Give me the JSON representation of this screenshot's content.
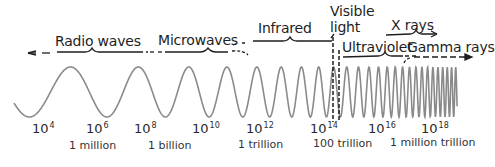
{
  "diagram": {
    "bands": [
      {
        "name": "Radio waves"
      },
      {
        "name": "Microwaves"
      },
      {
        "name": "Infrared"
      },
      {
        "name": "Visible light",
        "line1": "Visible",
        "line2": "light"
      },
      {
        "name": "Ultraviolet"
      },
      {
        "name": "X rays"
      },
      {
        "name": "Gamma rays"
      }
    ],
    "frequency_ticks": [
      {
        "base": "10",
        "exp": "4"
      },
      {
        "base": "10",
        "exp": "6"
      },
      {
        "base": "10",
        "exp": "8"
      },
      {
        "base": "10",
        "exp": "10"
      },
      {
        "base": "10",
        "exp": "12"
      },
      {
        "base": "10",
        "exp": "14"
      },
      {
        "base": "10",
        "exp": "16"
      },
      {
        "base": "10",
        "exp": "18"
      }
    ],
    "number_words": [
      {
        "label": "1 million"
      },
      {
        "label": "1 billion"
      },
      {
        "label": "1 trillion"
      },
      {
        "label": "100 trillion"
      },
      {
        "label": "1 million trillion"
      }
    ],
    "colors": {
      "wave": "#8a8a8a",
      "lines": "#1e1e1e",
      "text": "#1e1e1e"
    }
  }
}
